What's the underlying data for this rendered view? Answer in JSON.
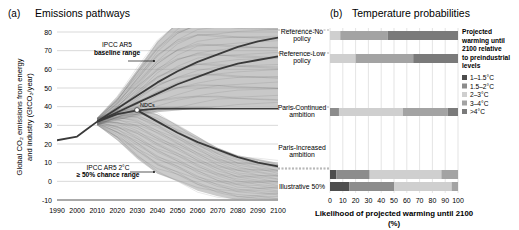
{
  "panel_a": {
    "label": "(a)",
    "title": "Emissions pathways",
    "ylabel_line1": "Global CO₂ emissions from energy",
    "ylabel_line2": "and industry (GtCO₂/year)",
    "annotations": {
      "baseline_1": "IPCC AR5",
      "baseline_2": "baseline range",
      "ndcs": "NDCs",
      "twoc_1": "IPCC AR5 2°C",
      "twoc_2": "≥ 50% chance range"
    }
  },
  "panel_b": {
    "label": "(b)",
    "title": "Temperature probabilities",
    "xlabel_line1": "Likelihood of projected warming until 2100",
    "xlabel_line2": "(%)",
    "legend_title": [
      "Projected",
      "warming until",
      "2100 relative",
      "to preindustrial",
      "levels"
    ]
  },
  "colors": {
    "t1": "#4d4d4d",
    "t2": "#8c8c8c",
    "t3": "#cfcfcf",
    "t4": "#a3a3a3",
    "t5": "#7a7a7a",
    "fan_baseline": "#9a9a9a",
    "fan_2c": "#a8a8a8",
    "thick_line": "#3a3a3a"
  },
  "chart_data": [
    {
      "type": "line",
      "title": "Emissions pathways",
      "xlabel": "",
      "ylabel": "Global CO2 emissions from energy and industry (GtCO2/year)",
      "x_ticks": [
        1990,
        2000,
        2010,
        2020,
        2030,
        2040,
        2050,
        2060,
        2070,
        2080,
        2090,
        2100
      ],
      "y_ticks": [
        -10,
        0,
        10,
        20,
        30,
        40,
        50,
        60,
        70,
        80
      ],
      "xlim": [
        1990,
        2100
      ],
      "ylim": [
        -10,
        80
      ],
      "grid": "horizontal",
      "series": [
        {
          "name": "Historical",
          "x": [
            1990,
            2000,
            2005,
            2010
          ],
          "y": [
            22,
            24,
            28,
            32
          ]
        },
        {
          "name": "Reference-No policy",
          "x": [
            2010,
            2020,
            2030,
            2040,
            2050,
            2060,
            2070,
            2080,
            2090,
            2100
          ],
          "y": [
            32,
            39,
            46,
            53,
            59,
            64,
            68,
            72,
            75,
            77
          ]
        },
        {
          "name": "Reference-Low policy",
          "x": [
            2010,
            2020,
            2030,
            2040,
            2050,
            2060,
            2070,
            2080,
            2090,
            2100
          ],
          "y": [
            32,
            37,
            42,
            47,
            52,
            56,
            60,
            63,
            65,
            67
          ]
        },
        {
          "name": "Paris-Continued ambition (NDCs)",
          "x": [
            2010,
            2020,
            2030,
            2040,
            2050,
            2060,
            2070,
            2080,
            2090,
            2100
          ],
          "y": [
            32,
            36,
            38,
            39,
            39,
            39,
            39,
            39,
            39,
            39
          ]
        },
        {
          "name": "Paris-Increased ambition",
          "x": [
            2030,
            2040,
            2050,
            2060,
            2070,
            2080,
            2090,
            2100
          ],
          "y": [
            38,
            32,
            26,
            21,
            17,
            13,
            10,
            8
          ]
        }
      ],
      "ranges": [
        {
          "name": "IPCC AR5 baseline range",
          "x": [
            2010,
            2020,
            2030,
            2040,
            2050,
            2060,
            2070,
            2080,
            2100
          ],
          "low": [
            30,
            33,
            35,
            37,
            38,
            39,
            40,
            40,
            40
          ],
          "high": [
            34,
            45,
            60,
            75,
            85,
            90,
            90,
            90,
            90
          ]
        },
        {
          "name": "IPCC AR5 2°C ≥50% chance range",
          "x": [
            2010,
            2020,
            2030,
            2040,
            2050,
            2060,
            2070,
            2080,
            2090,
            2100
          ],
          "low": [
            30,
            22,
            12,
            4,
            0,
            -5,
            -8,
            -10,
            -10,
            -10
          ],
          "high": [
            34,
            38,
            40,
            36,
            30,
            24,
            18,
            14,
            12,
            10
          ]
        }
      ],
      "annotations": [
        "IPCC AR5 baseline range",
        "NDCs",
        "IPCC AR5 2°C ≥ 50% chance range"
      ]
    },
    {
      "type": "bar",
      "orientation": "horizontal",
      "stacked": true,
      "title": "Temperature probabilities",
      "xlabel": "Likelihood of projected warming until 2100 (%)",
      "x_ticks": [
        0,
        10,
        20,
        30,
        40,
        50,
        60,
        70,
        80,
        90,
        100
      ],
      "xlim": [
        0,
        100
      ],
      "grid": "vertical",
      "legend_title": "Projected warming until 2100 relative to preindustrial levels",
      "legend_position": "right",
      "categories": [
        "Reference-No policy",
        "Reference-Low policy",
        "Paris-Continued ambition",
        "Paris-Increased ambition",
        "Illustrative 50%"
      ],
      "series": [
        {
          "name": "1–1.5°C",
          "values": [
            0,
            0,
            0,
            5,
            15
          ]
        },
        {
          "name": "1.5–2°C",
          "values": [
            0,
            0,
            7,
            26,
            35
          ]
        },
        {
          "name": "2–3°C",
          "values": [
            8,
            20,
            50,
            56,
            45
          ]
        },
        {
          "name": "3–4°C",
          "values": [
            37,
            45,
            35,
            13,
            5
          ]
        },
        {
          "name": ">4°C",
          "values": [
            55,
            35,
            8,
            0,
            0
          ]
        }
      ]
    }
  ]
}
